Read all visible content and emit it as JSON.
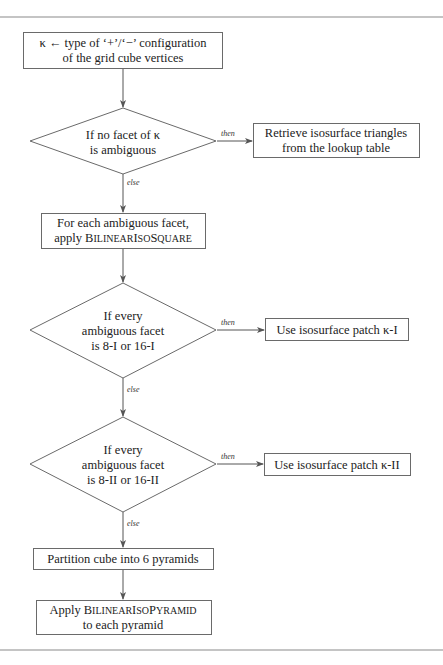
{
  "diagram": {
    "type": "flowchart",
    "nodes": {
      "start": {
        "shape": "rect",
        "line1": "κ ← type of ‘+’/‘−’ configuration",
        "line2": "of the grid cube vertices"
      },
      "decision1": {
        "shape": "diamond",
        "line1": "If no facet of κ",
        "line2": "is ambiguous"
      },
      "lookup": {
        "shape": "rect",
        "line1": "Retrieve isosurface triangles",
        "line2": "from the lookup table"
      },
      "apply_square": {
        "shape": "rect",
        "line1": "For each ambiguous facet,",
        "line2_prefix": "apply ",
        "line2_sc": [
          {
            "cap": "B",
            "small": "ILINEAR"
          },
          {
            "cap": "I",
            "small": "SO"
          },
          {
            "cap": "S",
            "small": "QUARE"
          }
        ]
      },
      "decision2": {
        "shape": "diamond",
        "line1": "If every",
        "line2": "ambiguous facet",
        "line3": "is 8-I or 16-I"
      },
      "patch1": {
        "shape": "rect",
        "line1": "Use isosurface patch κ-I"
      },
      "decision3": {
        "shape": "diamond",
        "line1": "If every",
        "line2": "ambiguous facet",
        "line3": "is 8-II or 16-II"
      },
      "patch2": {
        "shape": "rect",
        "line1": "Use isosurface patch κ-II"
      },
      "partition": {
        "shape": "rect",
        "line1": "Partition cube into 6 pyramids"
      },
      "apply_pyramid": {
        "shape": "rect",
        "line1_prefix": "Apply ",
        "line1_sc": [
          {
            "cap": "B",
            "small": "ILINEAR"
          },
          {
            "cap": "I",
            "small": "SO"
          },
          {
            "cap": "P",
            "small": "YRAMID"
          }
        ],
        "line2": "to each pyramid"
      }
    },
    "edges": [
      {
        "from": "start",
        "to": "decision1",
        "label": ""
      },
      {
        "from": "decision1",
        "to": "lookup",
        "label": "then"
      },
      {
        "from": "decision1",
        "to": "apply_square",
        "label": "else"
      },
      {
        "from": "apply_square",
        "to": "decision2",
        "label": ""
      },
      {
        "from": "decision2",
        "to": "patch1",
        "label": "then"
      },
      {
        "from": "decision2",
        "to": "decision3",
        "label": "else"
      },
      {
        "from": "decision3",
        "to": "patch2",
        "label": "then"
      },
      {
        "from": "decision3",
        "to": "partition",
        "label": "else"
      },
      {
        "from": "partition",
        "to": "apply_pyramid",
        "label": ""
      }
    ],
    "labels": {
      "then": "then",
      "else": "else"
    }
  }
}
